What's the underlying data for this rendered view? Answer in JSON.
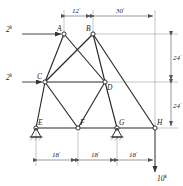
{
  "figure": {
    "type": "truss-diagram",
    "joints": [
      {
        "id": "A",
        "label": "A",
        "x": 64,
        "y": 34,
        "label_dx": -7,
        "label_dy": -3
      },
      {
        "id": "B",
        "label": "B",
        "x": 93,
        "y": 34,
        "label_dx": -7,
        "label_dy": -3
      },
      {
        "id": "C",
        "label": "C",
        "x": 45,
        "y": 82,
        "label_dx": -8,
        "label_dy": -3
      },
      {
        "id": "D",
        "label": "D",
        "x": 105,
        "y": 82,
        "label_dx": 2,
        "label_dy": 8
      },
      {
        "id": "E",
        "label": "E",
        "x": 36,
        "y": 128,
        "label_dx": 2,
        "label_dy": -3
      },
      {
        "id": "F",
        "label": "F",
        "x": 78,
        "y": 128,
        "label_dx": 2,
        "label_dy": -3
      },
      {
        "id": "G",
        "label": "G",
        "x": 117,
        "y": 128,
        "label_dx": 2,
        "label_dy": -3
      },
      {
        "id": "H",
        "label": "H",
        "x": 155,
        "y": 128,
        "label_dx": 2,
        "label_dy": -3
      }
    ],
    "members": [
      {
        "from": "A",
        "to": "C"
      },
      {
        "from": "A",
        "to": "D"
      },
      {
        "from": "B",
        "to": "C"
      },
      {
        "from": "B",
        "to": "D"
      },
      {
        "from": "B",
        "to": "H"
      },
      {
        "from": "C",
        "to": "D"
      },
      {
        "from": "C",
        "to": "E"
      },
      {
        "from": "C",
        "to": "F"
      },
      {
        "from": "D",
        "to": "F"
      },
      {
        "from": "D",
        "to": "G"
      },
      {
        "from": "E",
        "to": "F"
      },
      {
        "from": "F",
        "to": "G"
      },
      {
        "from": "G",
        "to": "H"
      }
    ],
    "supports": [
      {
        "at": "E",
        "kind": "pin-hatched"
      },
      {
        "at": "G",
        "kind": "pin-hatched"
      }
    ],
    "loads": [
      {
        "id": "load-a",
        "label": "2",
        "unit": "k",
        "at": "A",
        "direction": "right",
        "magnitude": 2
      },
      {
        "id": "load-c",
        "label": "2",
        "unit": "k",
        "at": "C",
        "direction": "right",
        "magnitude": 2
      },
      {
        "id": "load-h",
        "label": "10",
        "unit": "k",
        "at": "H",
        "direction": "down",
        "magnitude": 10
      }
    ],
    "dimensions": {
      "top": [
        {
          "id": "dim-12",
          "label": "12",
          "unit": "'",
          "from_x": 64,
          "to_x": 93,
          "y": 16
        },
        {
          "id": "dim-30",
          "label": "30",
          "unit": "'",
          "from_x": 93,
          "to_x": 155,
          "y": 16
        }
      ],
      "right": [
        {
          "id": "dim-24-upper",
          "label": "24",
          "unit": "'",
          "from_y": 34,
          "to_y": 82,
          "x": 171
        },
        {
          "id": "dim-24-lower",
          "label": "24",
          "unit": "'",
          "from_y": 82,
          "to_y": 128,
          "x": 171
        }
      ],
      "bottom": [
        {
          "id": "dim-18-left",
          "label": "18",
          "unit": "'",
          "from_x": 36,
          "to_x": 78,
          "y": 160
        },
        {
          "id": "dim-18-middle",
          "label": "18",
          "unit": "'",
          "from_x": 78,
          "to_x": 117,
          "y": 160
        },
        {
          "id": "dim-18-right",
          "label": "18",
          "unit": "'",
          "from_x": 117,
          "to_x": 155,
          "y": 160
        }
      ]
    },
    "colors": {
      "member": "#2a2a2a",
      "dimension": "#555555",
      "text": "#1a1a1a",
      "background": "#ffffff"
    }
  }
}
